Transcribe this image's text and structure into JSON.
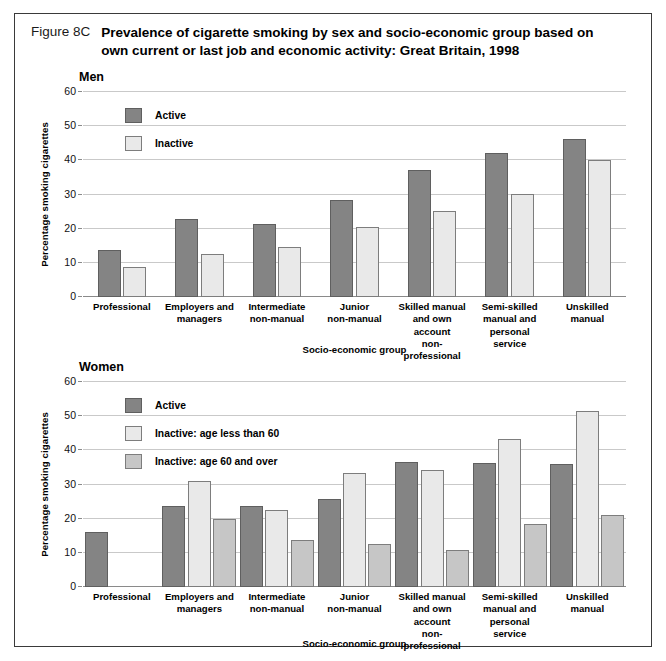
{
  "figure": {
    "number": "Figure 8C",
    "title": "Prevalence of cigarette smoking by sex and socio-economic group based on own current or last job and economic activity: Great Britain, 1998"
  },
  "chart_data": [
    {
      "type": "bar",
      "title": "Men",
      "xlabel": "Socio-economic group",
      "ylabel": "Percentage smoking cigarettes",
      "ylim": [
        0,
        60
      ],
      "yticks": [
        0,
        10,
        20,
        30,
        40,
        50,
        60
      ],
      "grid": true,
      "legend_position": "top-left",
      "categories": [
        "Professional",
        "Employers and managers",
        "Intermediate non-manual",
        "Junior non-manual",
        "Skilled manual and own account non-professional",
        "Semi-skilled manual and personal service",
        "Unskilled manual"
      ],
      "series": [
        {
          "name": "Active",
          "color": "#848484",
          "values": [
            13.8,
            22.8,
            21.5,
            28.5,
            37.3,
            42.2,
            46.2
          ]
        },
        {
          "name": "Inactive",
          "color": "#e9e9e9",
          "values": [
            8.9,
            12.7,
            14.6,
            20.5,
            25.3,
            30.2,
            40.0
          ]
        }
      ]
    },
    {
      "type": "bar",
      "title": "Women",
      "xlabel": "Socio-economic group",
      "ylabel": "Percentage smoking cigarettes",
      "ylim": [
        0,
        60
      ],
      "yticks": [
        0,
        10,
        20,
        30,
        40,
        50,
        60
      ],
      "grid": true,
      "legend_position": "top-left",
      "categories": [
        "Professional",
        "Employers and managers",
        "Intermediate non-manual",
        "Junior non-manual",
        "Skilled manual and own account non-professional",
        "Semi-skilled manual and personal service",
        "Unskilled manual"
      ],
      "series": [
        {
          "name": "Active",
          "color": "#848484",
          "values": [
            16.0,
            23.8,
            23.6,
            25.7,
            36.5,
            36.4,
            36.1
          ]
        },
        {
          "name": "Inactive: age less than 60",
          "color": "#e9e9e9",
          "values": [
            null,
            30.9,
            22.6,
            33.3,
            34.2,
            43.4,
            51.4
          ]
        },
        {
          "name": "Inactive: age 60 and over",
          "color": "#c6c6c6",
          "values": [
            null,
            19.8,
            13.7,
            12.7,
            10.7,
            18.4,
            21.0
          ]
        }
      ]
    }
  ],
  "panels": {
    "men": {
      "heading": "Men",
      "y_axis_title": "Percentage smoking cigarettes",
      "x_axis_title": "Socio-economic group",
      "yticks": [
        "60",
        "50",
        "40",
        "30",
        "20",
        "10",
        "0"
      ],
      "categories": [
        "Professional",
        "Employers and\nmanagers",
        "Intermediate\nnon-manual",
        "Junior\nnon-manual",
        "Skilled manual\nand own account\nnon-professional",
        "Semi-skilled\nmanual and\npersonal service",
        "Unskilled\nmanual"
      ],
      "legend": [
        "Active",
        "Inactive"
      ]
    },
    "women": {
      "heading": "Women",
      "y_axis_title": "Percentage smoking cigarettes",
      "x_axis_title": "Socio-economic group",
      "yticks": [
        "60",
        "50",
        "40",
        "30",
        "20",
        "10",
        "0"
      ],
      "categories": [
        "Professional",
        "Employers and\nmanagers",
        "Intermediate\nnon-manual",
        "Junior\nnon-manual",
        "Skilled manual\nand own account\nnon-professional",
        "Semi-skilled\nmanual and\npersonal service",
        "Unskilled\nmanual"
      ],
      "legend": [
        "Active",
        "Inactive: age less than 60",
        "Inactive: age 60 and over"
      ]
    }
  }
}
